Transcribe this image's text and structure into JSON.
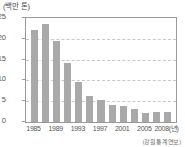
{
  "chart_data": {
    "type": "bar",
    "title": "",
    "subtitle": "",
    "unit_label": "(백만 톤)",
    "xlabel": "",
    "ylabel": "",
    "ylim": [
      0,
      25
    ],
    "yticks": [
      0,
      5,
      10,
      15,
      20,
      25
    ],
    "ytick_labels": [
      "0",
      "5",
      "10",
      "15",
      "20",
      "25"
    ],
    "grid": true,
    "grid_orientation": "horizontal",
    "legend": null,
    "legend_position": "none",
    "categories": [
      "1985",
      "1986",
      "1988",
      "1989",
      "1991",
      "1993",
      "1995",
      "1997",
      "1999",
      "2001",
      "2003",
      "2005",
      "2008"
    ],
    "values": [
      22.2,
      23.5,
      19.4,
      14.1,
      9.5,
      6.2,
      5.3,
      4.2,
      3.9,
      3.1,
      2.2,
      2.3,
      2.3
    ],
    "xtick_labels": [
      "1985",
      "1989",
      "1993",
      "1997",
      "2001",
      "2005",
      "2008(년)"
    ],
    "xtick_positions": [
      0,
      2,
      4,
      6,
      8,
      10,
      12
    ],
    "bar_color": "#a9a9a9",
    "grid_color": "#c9c9c9",
    "axis_color": "#9a9a9a",
    "text_color": "#555555",
    "background": "#ffffff",
    "source_note": "(강원통계연보)"
  }
}
